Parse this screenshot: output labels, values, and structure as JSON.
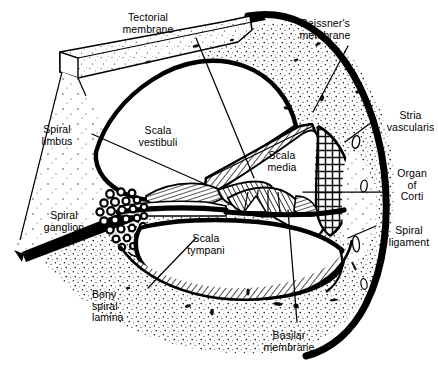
{
  "figure": {
    "style": "black-and-white line drawing with stipple and hatch shading",
    "colors": {
      "ink": "#000000",
      "paper": "#ffffff",
      "bone_stipple": "#efefef",
      "hatch": "#2a2a2a"
    }
  },
  "labels": [
    {
      "id": "tectorial-membrane",
      "text": "Tectorial\nmembrane",
      "align": "center",
      "x": 146,
      "y": 12
    },
    {
      "id": "reissners-membrane",
      "text": "Reissner's\nmembrane",
      "align": "center",
      "x": 323,
      "y": 18
    },
    {
      "id": "stria-vascularis",
      "text": "Stria\nvascularis",
      "align": "center",
      "x": 381,
      "y": 110
    },
    {
      "id": "organ-of-corti",
      "text": "Organ\nof\nCorti",
      "align": "center",
      "x": 393,
      "y": 168
    },
    {
      "id": "spiral-ligament",
      "text": "Spiral\nligament",
      "align": "center",
      "x": 383,
      "y": 225
    },
    {
      "id": "spiral-limbus",
      "text": "Spiral\nlimbus",
      "align": "center",
      "x": 57,
      "y": 124
    },
    {
      "id": "spiral-ganglion",
      "text": "Spiral\nganglion",
      "align": "center",
      "x": 63,
      "y": 210
    },
    {
      "id": "bony-spiral-lamina",
      "text": "Bony\nspiral\nlamina",
      "align": "left",
      "x": 92,
      "y": 289
    },
    {
      "id": "basilar-membrane",
      "text": "Basilar\nmembrane",
      "align": "center",
      "x": 288,
      "y": 330
    },
    {
      "id": "scala-vestibuli",
      "text": "Scala\nvestibuli",
      "align": "center",
      "x": 158,
      "y": 125
    },
    {
      "id": "scala-media",
      "text": "Scala\nmedia",
      "align": "center",
      "x": 281,
      "y": 150
    },
    {
      "id": "scala-tympani",
      "text": "Scala\ntympani",
      "align": "center",
      "x": 205,
      "y": 233
    }
  ],
  "leader_lines": [
    {
      "id": "leader-tectorial-membrane",
      "points": "196,38 254,178"
    },
    {
      "id": "leader-reissners-membrane",
      "points": "348,46 313,112"
    },
    {
      "id": "leader-stria-vascularis",
      "points": "372,122 345,142"
    },
    {
      "id": "leader-organ-of-corti",
      "points": "383,192 303,192"
    },
    {
      "id": "leader-spiral-ligament",
      "points": "376,226 348,238"
    },
    {
      "id": "leader-spiral-limbus",
      "points": "92,134 205,184"
    },
    {
      "id": "leader-bony-spiral-lamina",
      "points": "148,288 196,238"
    },
    {
      "id": "leader-basilar-membrane",
      "points": "297,322 288,210"
    }
  ],
  "structures": [
    {
      "id": "scala-vestibuli-chamber",
      "kind": "fluid-space"
    },
    {
      "id": "scala-media-chamber",
      "kind": "fluid-space"
    },
    {
      "id": "scala-tympani-chamber",
      "kind": "fluid-space"
    },
    {
      "id": "otic-capsule-bone",
      "kind": "stippled-bone"
    },
    {
      "id": "modiolus-wedge",
      "kind": "stippled-bone"
    },
    {
      "id": "reissners-membrane-band",
      "kind": "hatched-membrane"
    },
    {
      "id": "stria-vascularis-band",
      "kind": "reticulated-tissue"
    },
    {
      "id": "spiral-ligament-mass",
      "kind": "stippled-tissue"
    },
    {
      "id": "organ-of-corti-complex",
      "kind": "hatched-cells"
    },
    {
      "id": "basilar-membrane-line",
      "kind": "membrane"
    },
    {
      "id": "tectorial-membrane-flap",
      "kind": "membrane"
    },
    {
      "id": "spiral-limbus-mass",
      "kind": "hatched-tissue"
    },
    {
      "id": "bony-spiral-lamina-plate",
      "kind": "bone-plate"
    },
    {
      "id": "spiral-ganglion-cells",
      "kind": "cell-cluster",
      "count": 26
    }
  ]
}
